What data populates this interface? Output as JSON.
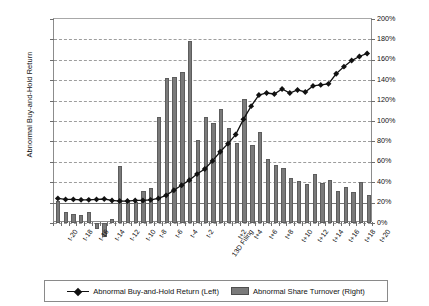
{
  "chart_data": {
    "type": "bar",
    "title": "",
    "xlabel": "",
    "ylabel": "Abnormal Buy-and-Hold Return",
    "y2label": "Abnormal Share Turnover Relative to  (t-100, t-40)",
    "grid": true,
    "legend_position": "bottom",
    "categories": [
      "t-20",
      "t-19",
      "t-18",
      "t-17",
      "t-16",
      "t-15",
      "t-14",
      "t-13",
      "t-12",
      "t-11",
      "t-10",
      "t-9",
      "t-8",
      "t-7",
      "t-6",
      "t-5",
      "t-4",
      "t-3",
      "t-2",
      "t-1",
      "13D Filing",
      "t+1",
      "t+2",
      "t+3",
      "t+4",
      "t+5",
      "t+6",
      "t+7",
      "t+8",
      "t+9",
      "t+10",
      "t+11",
      "t+12",
      "t+13",
      "t+14",
      "t+15",
      "t+16",
      "t+17",
      "t+18",
      "t+19",
      "t+20"
    ],
    "xtick_labels": [
      "t-20",
      "",
      "t-18",
      "",
      "t-16",
      "",
      "t-14",
      "",
      "t-12",
      "",
      "t-10",
      "",
      "t-8",
      "",
      "t-6",
      "",
      "t-4",
      "",
      "t-2",
      "",
      "13D Filing",
      "",
      "t+2",
      "",
      "t+4",
      "",
      "t+6",
      "",
      "t+8",
      "",
      "t+10",
      "",
      "t+12",
      "",
      "t+14",
      "",
      "t+16",
      "",
      "t+18",
      "",
      "t+20"
    ],
    "ylim": [
      -1,
      9
    ],
    "yticks": [
      -1,
      0,
      1,
      2,
      3,
      4,
      5,
      6,
      7,
      8,
      9
    ],
    "ytick_labels": [
      "-1%",
      "0%",
      "1%",
      "2%",
      "3%",
      "4%",
      "5%",
      "6%",
      "7%",
      "8%",
      "9%"
    ],
    "y2lim": [
      0,
      200
    ],
    "y2ticks": [
      0,
      20,
      40,
      60,
      80,
      100,
      120,
      140,
      160,
      180,
      200
    ],
    "y2tick_labels": [
      "0%",
      "20%",
      "40%",
      "60%",
      "80%",
      "100%",
      "120%",
      "140%",
      "160%",
      "180%",
      "200%"
    ],
    "series": [
      {
        "name": "Abnormal Buy-and-Hold Return (Left)",
        "type": "line",
        "axis": "left",
        "marker": "diamond",
        "color": "#111111",
        "values": [
          0.15,
          0.1,
          0.1,
          0.08,
          0.08,
          0.1,
          0.12,
          0.05,
          0.02,
          0.02,
          0.05,
          0.05,
          0.08,
          0.15,
          0.3,
          0.55,
          0.8,
          1.05,
          1.35,
          1.6,
          2.0,
          2.45,
          2.85,
          3.3,
          4.05,
          4.7,
          5.25,
          5.35,
          5.3,
          5.55,
          5.35,
          5.5,
          5.4,
          5.7,
          5.75,
          5.8,
          6.3,
          6.65,
          6.95,
          7.15,
          7.3
        ]
      },
      {
        "name": "Abnormal Share Turnover (Right)",
        "type": "bar",
        "axis": "right",
        "color": "#7a7a7a",
        "values": [
          22,
          11,
          9,
          8,
          11,
          -6,
          -14,
          4,
          56,
          23,
          21,
          31,
          34,
          104,
          142,
          143,
          148,
          178,
          81,
          104,
          98,
          112,
          93,
          78,
          122,
          76,
          89,
          63,
          57,
          54,
          44,
          41,
          38,
          48,
          39,
          42,
          31,
          35,
          30,
          40,
          27
        ]
      }
    ]
  },
  "legend": {
    "items": [
      {
        "label": "Abnormal Buy-and-Hold Return (Left)",
        "marker": "line-diamond-icon"
      },
      {
        "label": "Abnormal Share Turnover (Right)",
        "marker": "bar-swatch-icon"
      }
    ]
  }
}
